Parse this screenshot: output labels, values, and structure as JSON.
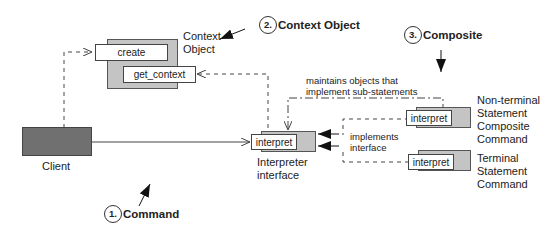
{
  "diagram": {
    "type": "Interpreter pattern structure",
    "nodes": {
      "context_object": {
        "label_line1": "Context",
        "label_line2": "Object",
        "methods": [
          "create",
          "get_context"
        ]
      },
      "client": {
        "label": "Client"
      },
      "interpreter_interface": {
        "label_line1": "Interpreter",
        "label_line2": "interface",
        "method": "interpret"
      },
      "nonterminal": {
        "label_lines": [
          "Non-terminal",
          "Statement",
          "Composite",
          "Command"
        ],
        "method": "interpret"
      },
      "terminal": {
        "label_lines": [
          "Terminal",
          "Statement",
          "Command"
        ],
        "method": "interpret"
      }
    },
    "edge_labels": {
      "maintains_line1": "maintains objects that",
      "maintains_line2": "implement sub-statements",
      "implements_line1": "implements",
      "implements_line2": "interface"
    },
    "callouts": [
      {
        "number": "1.",
        "label": "Command"
      },
      {
        "number": "2.",
        "label": "Context Object"
      },
      {
        "number": "3.",
        "label": "Composite"
      }
    ],
    "colors": {
      "box_fill": "#c4c4c4",
      "client_fill": "#707070",
      "line": "#444444"
    }
  }
}
